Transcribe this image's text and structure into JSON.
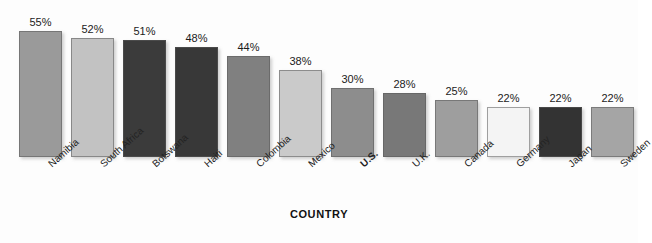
{
  "chart_data": {
    "type": "bar",
    "title": "",
    "subtitle": "",
    "xlabel": "COUNTRY",
    "ylabel": "",
    "ylim": [
      0,
      60
    ],
    "grid": false,
    "legend": "none",
    "value_label_suffix": "%",
    "categories": [
      "Namibia",
      "South Africa",
      "Botswana",
      "Haiti",
      "Colombia",
      "Mexico",
      "U.S.",
      "U.K.",
      "Canada",
      "Germany",
      "Japan",
      "Sweden"
    ],
    "values": [
      55,
      52,
      51,
      48,
      44,
      38,
      30,
      28,
      25,
      22,
      22,
      22
    ],
    "value_labels": [
      "55%",
      "52%",
      "51%",
      "48%",
      "44%",
      "38%",
      "30%",
      "28%",
      "25%",
      "22%",
      "22%",
      "22%"
    ],
    "bar_colors": [
      "#9a9a9a",
      "#c2c2c2",
      "#3b3b3b",
      "#383838",
      "#808080",
      "#cacaca",
      "#8d8d8d",
      "#787878",
      "#9e9e9e",
      "#f4f4f4",
      "#333333",
      "#a5a5a5"
    ],
    "emphasized_category": "U.S.",
    "axis_label_rotation_deg": -42
  }
}
